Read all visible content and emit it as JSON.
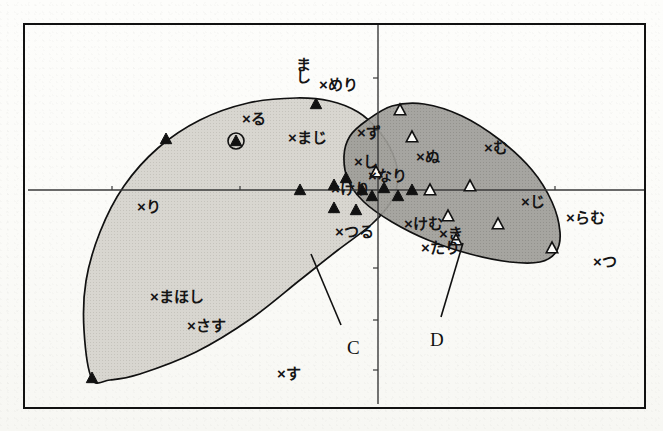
{
  "figure": {
    "background": "#fdfdfb",
    "frame_color": "#111111",
    "axis_color": "#3a3a3a"
  },
  "chart_data": {
    "type": "scatter",
    "title": "",
    "xlabel": "",
    "ylabel": "",
    "grid": false,
    "legend_position": "none",
    "axes": {
      "origin_px": [
        378,
        190
      ],
      "x_axis_y_px": 190,
      "y_axis_x_px": 378,
      "frame_px": [
        24,
        24,
        645,
        408
      ],
      "x_ticks_px": [
        112,
        240,
        470,
        555
      ],
      "y_ticks_px": [
        78,
        130,
        268,
        320,
        370
      ]
    },
    "regions": [
      {
        "name": "C",
        "label": "C",
        "fill": "#d3d1cb",
        "stroke": "#111111",
        "marker": "filled-triangle",
        "label_pos_px": [
          347,
          338
        ],
        "leader_px": [
          [
            311,
            254
          ],
          [
            341,
            325
          ]
        ],
        "hull_px": [
          [
            92,
            379
          ],
          [
            84,
            330
          ],
          [
            86,
            281
          ],
          [
            100,
            232
          ],
          [
            124,
            186
          ],
          [
            158,
            148
          ],
          [
            200,
            120
          ],
          [
            248,
            103
          ],
          [
            296,
            98
          ],
          [
            330,
            101
          ],
          [
            358,
            112
          ],
          [
            378,
            130
          ],
          [
            392,
            152
          ],
          [
            398,
            176
          ],
          [
            392,
            200
          ],
          [
            372,
            224
          ],
          [
            338,
            250
          ],
          [
            300,
            280
          ],
          [
            252,
            318
          ],
          [
            196,
            352
          ],
          [
            140,
            374
          ],
          [
            110,
            380
          ]
        ]
      },
      {
        "name": "D",
        "label": "D",
        "fill": "#9b9a95",
        "stroke": "#111111",
        "marker": "open-triangle",
        "label_pos_px": [
          430,
          330
        ],
        "leader_px": [
          [
            463,
            243
          ],
          [
            441,
            317
          ]
        ],
        "hull_px": [
          [
            366,
            121
          ],
          [
            392,
            106
          ],
          [
            424,
            104
          ],
          [
            462,
            116
          ],
          [
            500,
            140
          ],
          [
            532,
            170
          ],
          [
            552,
            202
          ],
          [
            560,
            232
          ],
          [
            556,
            252
          ],
          [
            540,
            262
          ],
          [
            510,
            262
          ],
          [
            470,
            254
          ],
          [
            428,
            240
          ],
          [
            392,
            222
          ],
          [
            364,
            202
          ],
          [
            348,
            180
          ],
          [
            344,
            156
          ],
          [
            350,
            136
          ]
        ]
      }
    ],
    "markers": {
      "filled_triangle_px": [
        [
          166,
          139
        ],
        [
          236,
          141
        ],
        [
          316,
          104
        ],
        [
          300,
          190
        ],
        [
          334,
          185
        ],
        [
          346,
          178
        ],
        [
          334,
          208
        ],
        [
          356,
          210
        ],
        [
          362,
          190
        ],
        [
          372,
          196
        ],
        [
          376,
          172
        ],
        [
          384,
          188
        ],
        [
          398,
          196
        ],
        [
          412,
          190
        ],
        [
          92,
          378
        ]
      ],
      "open_triangle_px": [
        [
          400,
          110
        ],
        [
          412,
          137
        ],
        [
          376,
          172
        ],
        [
          430,
          190
        ],
        [
          470,
          186
        ],
        [
          448,
          216
        ],
        [
          498,
          224
        ],
        [
          456,
          240
        ],
        [
          552,
          248
        ]
      ],
      "circled_triangle_px": [
        [
          236,
          141
        ]
      ]
    },
    "points": [
      {
        "label": "り",
        "x_px": 146,
        "y_px": 208,
        "marker": "x"
      },
      {
        "label": "る",
        "x_px": 251,
        "y_px": 120,
        "marker": "x"
      },
      {
        "label": "まじ",
        "x_px": 297,
        "y_px": 139,
        "marker": "x"
      },
      {
        "label": "まし",
        "x_px": 305,
        "y_px": 69,
        "marker": "x",
        "orientation": "vertical"
      },
      {
        "label": "めり",
        "x_px": 328,
        "y_px": 86,
        "marker": "x"
      },
      {
        "label": "ず",
        "x_px": 366,
        "y_px": 134,
        "marker": "x"
      },
      {
        "label": "し",
        "x_px": 363,
        "y_px": 163,
        "marker": "x"
      },
      {
        "label": "なり",
        "x_px": 377,
        "y_px": 177,
        "marker": "x"
      },
      {
        "label": "けり",
        "x_px": 340,
        "y_px": 190,
        "marker": "x"
      },
      {
        "label": "ぬ",
        "x_px": 425,
        "y_px": 158,
        "marker": "x"
      },
      {
        "label": "む",
        "x_px": 493,
        "y_px": 149,
        "marker": "x"
      },
      {
        "label": "じ",
        "x_px": 530,
        "y_px": 203,
        "marker": "x"
      },
      {
        "label": "らむ",
        "x_px": 575,
        "y_px": 219,
        "marker": "x"
      },
      {
        "label": "つ",
        "x_px": 602,
        "y_px": 263,
        "marker": "x"
      },
      {
        "label": "つる",
        "x_px": 344,
        "y_px": 233,
        "marker": "x"
      },
      {
        "label": "けむ",
        "x_px": 413,
        "y_px": 225,
        "marker": "x"
      },
      {
        "label": "き",
        "x_px": 448,
        "y_px": 235,
        "marker": "x"
      },
      {
        "label": "たり",
        "x_px": 430,
        "y_px": 249,
        "marker": "x"
      },
      {
        "label": "まほし",
        "x_px": 159,
        "y_px": 298,
        "marker": "x"
      },
      {
        "label": "さす",
        "x_px": 196,
        "y_px": 327,
        "marker": "x"
      },
      {
        "label": "す",
        "x_px": 286,
        "y_px": 375,
        "marker": "x"
      }
    ]
  }
}
